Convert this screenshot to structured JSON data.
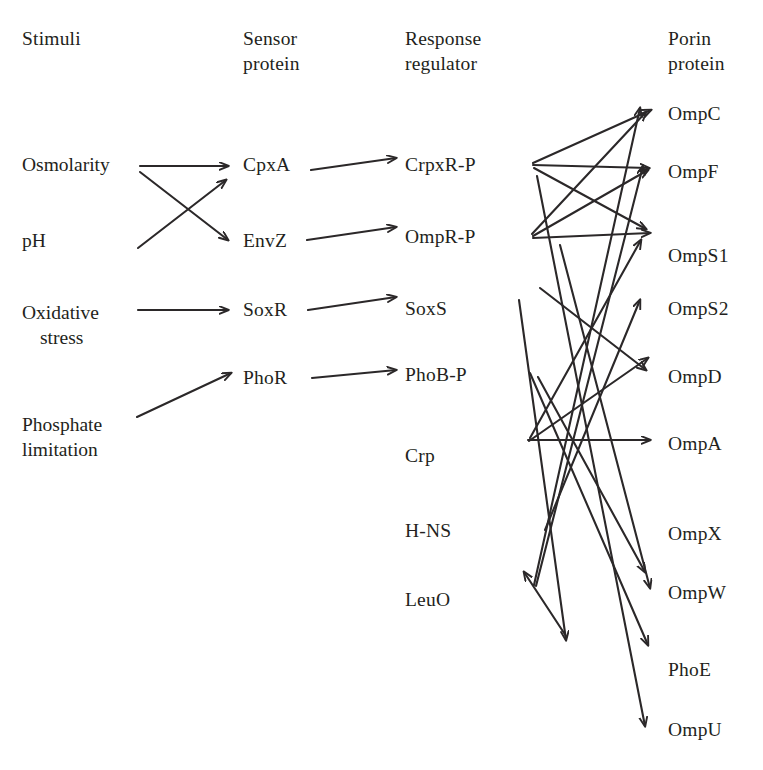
{
  "figure": {
    "type": "diagram",
    "background_color": "#ffffff",
    "line_color": "#2b2829"
  },
  "columns": [
    {
      "id": "stimuli",
      "header_line1": "Stimuli",
      "header_line2": "",
      "x": 22,
      "header_y": 26
    },
    {
      "id": "sensor",
      "header_line1": "Sensor",
      "header_line2": "protein",
      "x": 243,
      "header_y": 26
    },
    {
      "id": "regulator",
      "header_line1": "Response",
      "header_line2": "regulator",
      "x": 405,
      "header_y": 26
    },
    {
      "id": "porin",
      "header_line1": "Porin",
      "header_line2": "protein",
      "x": 668,
      "header_y": 26
    }
  ],
  "stimuli": [
    {
      "id": "osmolarity",
      "line1": "Osmolarity",
      "line2": "",
      "x": 22,
      "y": 152
    },
    {
      "id": "ph",
      "line1": "pH",
      "line2": "",
      "x": 22,
      "y": 228
    },
    {
      "id": "oxidative",
      "line1": "Oxidative",
      "line2": "stress",
      "x": 22,
      "y": 300,
      "indent": true
    },
    {
      "id": "phosphate",
      "line1": "Phosphate",
      "line2": "limitation",
      "x": 22,
      "y": 412
    }
  ],
  "sensor_proteins": [
    {
      "id": "cpxa",
      "label": "CpxA",
      "x": 243,
      "y": 152
    },
    {
      "id": "envz",
      "label": "EnvZ",
      "x": 243,
      "y": 228
    },
    {
      "id": "soxr",
      "label": "SoxR",
      "x": 243,
      "y": 297
    },
    {
      "id": "phor",
      "label": "PhoR",
      "x": 243,
      "y": 365
    }
  ],
  "response_regulators": [
    {
      "id": "crpxr",
      "label": "CrpxR-P",
      "x": 405,
      "y": 152
    },
    {
      "id": "ompr",
      "label": "OmpR-P",
      "x": 405,
      "y": 224
    },
    {
      "id": "soxs",
      "label": "SoxS",
      "x": 405,
      "y": 296
    },
    {
      "id": "phob",
      "label": "PhoB-P",
      "x": 405,
      "y": 362
    },
    {
      "id": "crp",
      "label": "Crp",
      "x": 405,
      "y": 443
    },
    {
      "id": "hns",
      "label": "H-NS",
      "x": 405,
      "y": 518
    },
    {
      "id": "leuo",
      "label": "LeuO",
      "x": 405,
      "y": 587
    }
  ],
  "porin_proteins": [
    {
      "id": "ompc",
      "label": "OmpC",
      "x": 668,
      "y": 101
    },
    {
      "id": "ompf",
      "label": "OmpF",
      "x": 668,
      "y": 159
    },
    {
      "id": "omps1",
      "label": "OmpS1",
      "x": 668,
      "y": 243
    },
    {
      "id": "omps2",
      "label": "OmpS2",
      "x": 668,
      "y": 296
    },
    {
      "id": "ompd",
      "label": "OmpD",
      "x": 668,
      "y": 364
    },
    {
      "id": "ompa",
      "label": "OmpA",
      "x": 668,
      "y": 431
    },
    {
      "id": "ompx",
      "label": "OmpX",
      "x": 668,
      "y": 521
    },
    {
      "id": "ompw",
      "label": "OmpW",
      "x": 668,
      "y": 580
    },
    {
      "id": "phoe",
      "label": "PhoE",
      "x": 668,
      "y": 657
    },
    {
      "id": "ompu",
      "label": "OmpU",
      "x": 668,
      "y": 717
    }
  ],
  "edges": [
    {
      "id": "osmolarity-cpxa",
      "from": "Osmolarity",
      "to": "CpxA",
      "x1": 140,
      "y1": 166,
      "x2": 228,
      "y2": 166
    },
    {
      "id": "osmolarity-envz",
      "from": "Osmolarity",
      "to": "EnvZ",
      "x1": 140,
      "y1": 172,
      "x2": 228,
      "y2": 240
    },
    {
      "id": "ph-cpxa",
      "from": "pH",
      "to": "CpxA",
      "x1": 138,
      "y1": 248,
      "x2": 226,
      "y2": 180
    },
    {
      "id": "oxidative-soxr",
      "from": "Oxidative stress",
      "to": "SoxR",
      "x1": 138,
      "y1": 310,
      "x2": 228,
      "y2": 310
    },
    {
      "id": "phosphate-phor",
      "from": "Phosphate limitation",
      "to": "PhoR",
      "x1": 137,
      "y1": 417,
      "x2": 231,
      "y2": 373
    },
    {
      "id": "cpxa-crpxr",
      "from": "CpxA",
      "to": "CrpxR-P",
      "x1": 311,
      "y1": 170,
      "x2": 396,
      "y2": 158
    },
    {
      "id": "envz-ompr",
      "from": "EnvZ",
      "to": "OmpR-P",
      "x1": 307,
      "y1": 240,
      "x2": 396,
      "y2": 227
    },
    {
      "id": "soxr-soxs",
      "from": "SoxR",
      "to": "SoxS",
      "x1": 308,
      "y1": 310,
      "x2": 396,
      "y2": 297
    },
    {
      "id": "phor-phob",
      "from": "PhoR",
      "to": "PhoB-P",
      "x1": 312,
      "y1": 378,
      "x2": 396,
      "y2": 370
    },
    {
      "id": "crpxr-ompc",
      "from": "CrpxR-P",
      "to": "OmpC",
      "x1": 533,
      "y1": 163,
      "x2": 651,
      "y2": 110
    },
    {
      "id": "crpxr-ompf",
      "from": "CrpxR-P",
      "to": "OmpF",
      "x1": 533,
      "y1": 165,
      "x2": 649,
      "y2": 168
    },
    {
      "id": "crpxr-omps1",
      "from": "CrpxR-P",
      "to": "OmpS1",
      "x1": 534,
      "y1": 168,
      "x2": 646,
      "y2": 229
    },
    {
      "id": "ompr-ompc",
      "from": "OmpR-P",
      "to": "OmpC",
      "x1": 532,
      "y1": 234,
      "x2": 646,
      "y2": 112
    },
    {
      "id": "ompr-ompf",
      "from": "OmpR-P",
      "to": "OmpF",
      "x1": 533,
      "y1": 236,
      "x2": 648,
      "y2": 170
    },
    {
      "id": "ompr-omps1",
      "from": "OmpR-P",
      "to": "OmpS1",
      "x1": 533,
      "y1": 238,
      "x2": 650,
      "y2": 233
    },
    {
      "id": "soxs-omps2",
      "from": "SoxS",
      "to": "OmpS2",
      "x1": 540,
      "y1": 288,
      "x2": 646,
      "y2": 370
    },
    {
      "id": "phob-phoe",
      "from": "PhoB-P",
      "to": "PhoE",
      "x1": 530,
      "y1": 373,
      "x2": 648,
      "y2": 645
    },
    {
      "id": "phob-ompw",
      "from": "PhoB-P",
      "to": "OmpW",
      "x1": 538,
      "y1": 377,
      "x2": 645,
      "y2": 572
    },
    {
      "id": "crp-ompa",
      "from": "Crp",
      "to": "OmpA",
      "x1": 528,
      "y1": 440,
      "x2": 650,
      "y2": 440
    },
    {
      "id": "crp-ompd",
      "from": "Crp",
      "to": "OmpD",
      "x1": 529,
      "y1": 441,
      "x2": 648,
      "y2": 358
    },
    {
      "id": "crp-omps1",
      "from": "Crp",
      "to": "OmpS1",
      "x1": 530,
      "y1": 438,
      "x2": 641,
      "y2": 240
    },
    {
      "id": "hns-omps2",
      "from": "H-NS",
      "to": "OmpS2",
      "x1": 545,
      "y1": 530,
      "x2": 640,
      "y2": 300
    },
    {
      "id": "leuo-ompc",
      "from": "LeuO",
      "to": "OmpC",
      "x1": 534,
      "y1": 585,
      "x2": 640,
      "y2": 108
    },
    {
      "id": "leuo-ompf",
      "from": "LeuO",
      "to": "OmpF",
      "x1": 536,
      "y1": 586,
      "x2": 643,
      "y2": 166
    },
    {
      "id": "leuo-up-left",
      "from": "H-NS",
      "to": "LeuO",
      "x1": 566,
      "y1": 636,
      "x2": 524,
      "y2": 572
    },
    {
      "id": "crpxr-ompu",
      "from": "CrpxR-P",
      "to": "OmpU",
      "x1": 537,
      "y1": 176,
      "x2": 645,
      "y2": 726
    },
    {
      "id": "ompr-ompw2",
      "from": "OmpR-P",
      "to": "OmpW",
      "x1": 560,
      "y1": 245,
      "x2": 650,
      "y2": 588
    },
    {
      "id": "soxs-ompw",
      "from": "SoxS",
      "to": "OmpW",
      "x1": 519,
      "y1": 300,
      "x2": 566,
      "y2": 640
    }
  ]
}
